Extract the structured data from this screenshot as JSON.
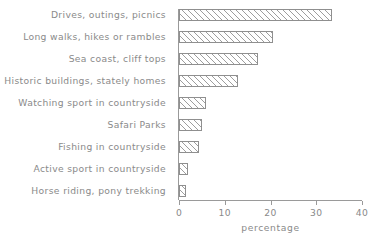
{
  "chart_data": {
    "type": "bar",
    "orientation": "horizontal",
    "title": "",
    "xlabel": "percentage",
    "ylabel": "",
    "xlim": [
      0,
      40
    ],
    "xticks": [
      0,
      10,
      20,
      30,
      40
    ],
    "xtick_labels": [
      "0",
      "10",
      "20",
      "30",
      "40"
    ],
    "grid": false,
    "legend": null,
    "bar_style": {
      "fill": "hatched-diagonal",
      "edge_color": "#8f8f8f",
      "face_color": "#ffffff",
      "hatch_color": "#9d9d9d"
    },
    "categories": [
      "Drives, outings, picnics",
      "Long walks, hikes or rambles",
      "Sea coast, cliff tops",
      "Historic buildings, stately homes",
      "Watching sport in countryside",
      "Safari Parks",
      "Fishing in countryside",
      "Active sport in countryside",
      "Horse riding, pony trekking"
    ],
    "values": [
      33.5,
      20.5,
      17.3,
      12.8,
      6.0,
      5.0,
      4.3,
      2.0,
      1.5
    ]
  }
}
